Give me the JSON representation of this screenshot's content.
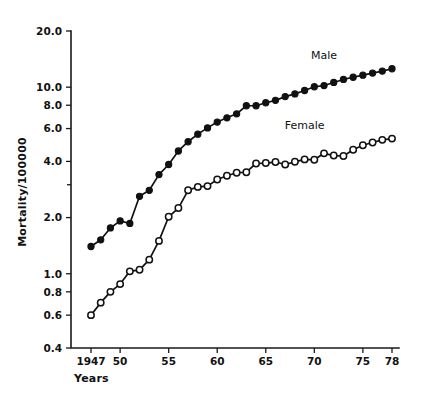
{
  "chart_data": {
    "type": "line",
    "title": "",
    "subtitle": "",
    "xlabel": "Years",
    "ylabel": "Mortality/100000",
    "yscale": "log",
    "ylim": [
      0.4,
      20.0
    ],
    "xlim": [
      1947,
      1978
    ],
    "grid": false,
    "legend_position": "inline-annotations",
    "x_tick_labels": [
      "1947",
      "50",
      "55",
      "60",
      "65",
      "70",
      "75",
      "78"
    ],
    "x_tick_values": [
      1947,
      1950,
      1955,
      1960,
      1965,
      1970,
      1975,
      1978
    ],
    "y_tick_labels": [
      "20.0",
      "10.0",
      "8.0",
      "6.0",
      "4.0",
      "2.0",
      "1.0",
      "0.8",
      "0.6",
      "0.4"
    ],
    "y_tick_values": [
      20.0,
      10.0,
      8.0,
      6.0,
      4.0,
      2.0,
      1.0,
      0.8,
      0.6,
      0.4
    ],
    "y_minor_tick_values": [
      3.0
    ],
    "x": [
      1947,
      1948,
      1949,
      1950,
      1951,
      1952,
      1953,
      1954,
      1955,
      1956,
      1957,
      1958,
      1959,
      1960,
      1961,
      1962,
      1963,
      1964,
      1965,
      1966,
      1967,
      1968,
      1969,
      1970,
      1971,
      1972,
      1973,
      1974,
      1975,
      1976,
      1977,
      1978
    ],
    "series": [
      {
        "name": "Male",
        "marker": "filled-circle",
        "color": "#111111",
        "label_x": 1971,
        "label_y": 14.2,
        "values": [
          1.4,
          1.52,
          1.76,
          1.92,
          1.86,
          2.6,
          2.8,
          3.4,
          3.85,
          4.55,
          5.1,
          5.6,
          6.05,
          6.5,
          6.85,
          7.2,
          7.95,
          7.95,
          8.25,
          8.5,
          8.9,
          9.2,
          9.6,
          10.05,
          10.2,
          10.6,
          11.0,
          11.3,
          11.6,
          11.9,
          12.2,
          12.55
        ]
      },
      {
        "name": "Female",
        "marker": "open-circle",
        "color": "#111111",
        "label_x": 1969,
        "label_y": 6.0,
        "values": [
          0.6,
          0.7,
          0.8,
          0.88,
          1.03,
          1.05,
          1.19,
          1.5,
          2.02,
          2.25,
          2.8,
          2.92,
          2.95,
          3.2,
          3.35,
          3.48,
          3.5,
          3.9,
          3.92,
          3.97,
          3.85,
          3.98,
          4.1,
          4.08,
          4.42,
          4.3,
          4.28,
          4.62,
          4.88,
          5.05,
          5.22,
          5.3
        ]
      }
    ]
  },
  "axes": {
    "x_axis_name": "years-axis",
    "y_axis_name": "mortality-axis"
  }
}
